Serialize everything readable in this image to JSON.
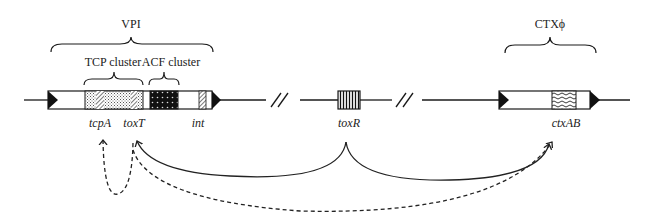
{
  "regions": {
    "vpi": {
      "label": "VPI"
    },
    "tcp_cluster": {
      "label": "TCP cluster"
    },
    "acf_cluster": {
      "label": "ACF cluster"
    },
    "ctx": {
      "label": "CTXϕ"
    }
  },
  "genes": {
    "tcpA": "tcpA",
    "toxT": "toxT",
    "int": "int",
    "toxR": "toxR",
    "ctxAB": "ctxAB"
  },
  "arrows": [
    {
      "from": "toxR",
      "to": "toxT",
      "style": "solid"
    },
    {
      "from": "toxR",
      "to": "ctxAB",
      "style": "solid"
    },
    {
      "from": "toxT",
      "to": "tcpA",
      "style": "dashed"
    },
    {
      "from": "toxT",
      "to": "ctxAB",
      "style": "dashed"
    }
  ],
  "colors": {
    "ink": "#1a1a1a",
    "background": "#ffffff"
  }
}
